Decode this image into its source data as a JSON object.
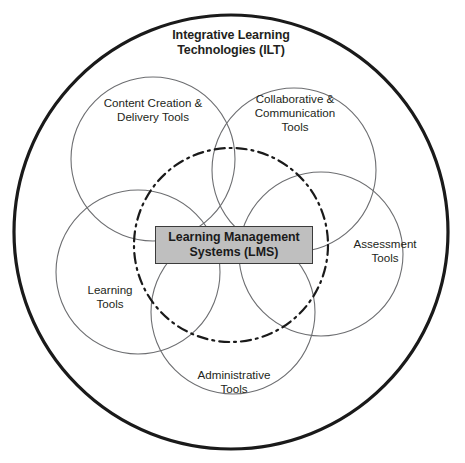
{
  "diagram": {
    "type": "venn-overlap-circles",
    "outer": {
      "label": "Integrative Learning\nTechnologies (ILT)",
      "stroke_color": "#1a1a1a",
      "cx": 231,
      "cy": 232,
      "r": 217,
      "stroke_width": 3.2
    },
    "center_node": {
      "label": "Learning Management\nSystems (LMS)",
      "fill_color": "#bfbfbf",
      "border_color": "#3b3b3b",
      "x": 155,
      "y": 226,
      "width": 158,
      "height": 38
    },
    "dashdot_circle": {
      "cx": 231,
      "cy": 245,
      "r": 97,
      "stroke_color": "#1a1a1a",
      "stroke_width": 2.2,
      "dash_pattern": "10 5 2 5"
    },
    "petal_stroke_color": "#6d6e71",
    "petal_stroke_width": 1.1,
    "petals": [
      {
        "id": "content-creation",
        "label": "Content Creation &\nDelivery Tools",
        "cx": 153,
        "cy": 159,
        "r": 82,
        "label_x": 85,
        "label_y": 96,
        "label_w": 136
      },
      {
        "id": "collaborative-communication",
        "label": "Collaborative &\nCommunication\nTools",
        "cx": 294,
        "cy": 170,
        "r": 82,
        "label_x": 233,
        "label_y": 92,
        "label_w": 124
      },
      {
        "id": "assessment",
        "label": "Assessment\nTools",
        "cx": 321,
        "cy": 254,
        "r": 82,
        "label_x": 333,
        "label_y": 237,
        "label_w": 104
      },
      {
        "id": "administrative",
        "label": "Administrative\nTools",
        "cx": 233,
        "cy": 312,
        "r": 82,
        "label_x": 172,
        "label_y": 368,
        "label_w": 124
      },
      {
        "id": "learning-tools",
        "label": "Learning\nTools",
        "cx": 138,
        "cy": 272,
        "r": 82,
        "label_x": 62,
        "label_y": 283,
        "label_w": 96
      }
    ]
  }
}
